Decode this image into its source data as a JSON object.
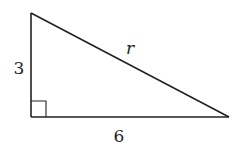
{
  "diagram": {
    "type": "right-triangle",
    "labels": {
      "vertical_leg": "3",
      "horizontal_leg": "6",
      "hypotenuse": "r"
    },
    "right_angle_marker": true,
    "colors": {
      "stroke": "#222222",
      "background": "#ffffff"
    }
  }
}
